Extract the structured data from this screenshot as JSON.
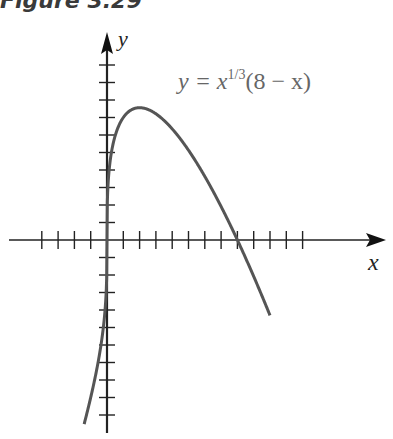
{
  "figure": {
    "caption": "Figure 3.29"
  },
  "chart_data": {
    "type": "line",
    "title": "Figure 3.29",
    "function": "y = x^(1/3)(8 - x)",
    "xlabel": "x",
    "ylabel": "y",
    "annotation": "y = x1/3(8 − x)",
    "annotation_parts": {
      "lhs": "y  =  x",
      "exp": "1/3",
      "rhs": "(8  −  x)"
    },
    "xlim": [
      -6,
      12
    ],
    "ylim": [
      -11,
      12
    ],
    "x_ticks": [
      -4,
      -3,
      -2,
      -1,
      1,
      2,
      3,
      4,
      5,
      6,
      7,
      8,
      9,
      10,
      11,
      12
    ],
    "y_ticks": [
      -10,
      -9,
      -8,
      -7,
      -6,
      -5,
      -4,
      -3,
      -2,
      -1,
      1,
      2,
      3,
      4,
      5,
      6,
      7,
      8,
      9,
      10
    ],
    "tick_labels_shown": false,
    "grid": false,
    "key_points": [
      {
        "x": -1.4,
        "y": -10.5
      },
      {
        "x": -1,
        "y": -9
      },
      {
        "x": 0,
        "y": 0
      },
      {
        "x": 1,
        "y": 7
      },
      {
        "x": 2,
        "y": 7.56
      },
      {
        "x": 4,
        "y": 6.35
      },
      {
        "x": 6,
        "y": 3.63
      },
      {
        "x": 8,
        "y": 0
      },
      {
        "x": 10,
        "y": -4.31
      }
    ],
    "series": [
      {
        "name": "y = x^(1/3)(8 - x)",
        "color": "#555555"
      }
    ]
  }
}
